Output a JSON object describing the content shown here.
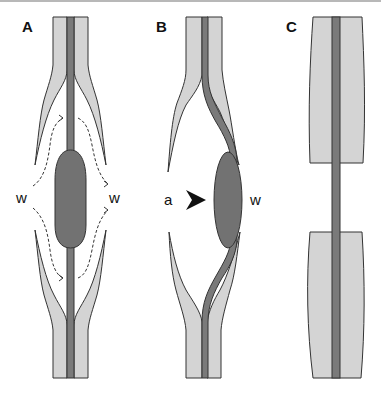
{
  "figure": {
    "panels": [
      {
        "id": "A",
        "label": "A",
        "flow_labels": {
          "left": "w",
          "right": "w"
        }
      },
      {
        "id": "B",
        "label": "B",
        "arrow_label": "a",
        "flow_label_right": "w"
      },
      {
        "id": "C",
        "label": "C"
      }
    ],
    "colors": {
      "sheath": "#d4d4d4",
      "core": "#7a7a7a",
      "bulge": "#727272",
      "outline": "#333333",
      "arrow": "#111111"
    }
  }
}
